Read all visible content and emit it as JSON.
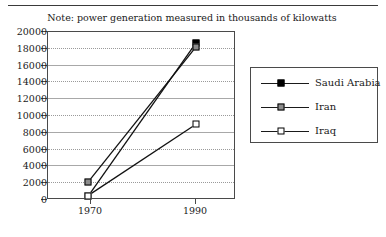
{
  "note": "Note: power generation measured in thousands of kilowatts",
  "top_caption_ghost": "",
  "legend": {
    "items": [
      {
        "label": "Saudi  Arabia",
        "marker": "filled-square-marker",
        "color": "#000000"
      },
      {
        "label": "Iran",
        "marker": "half-filled-square-marker",
        "color": "#8c8c8c"
      },
      {
        "label": "Iraq",
        "marker": "open-square-marker",
        "color": "#ffffff"
      }
    ]
  },
  "chart_data": {
    "type": "line",
    "title": "",
    "subtitle": "Note: power generation measured in thousands of kilowatts",
    "xlabel": "",
    "ylabel": "",
    "x": [
      "1970",
      "1990"
    ],
    "categories": [
      "1970",
      "1990"
    ],
    "xtick_labels": [
      "1970",
      "1990"
    ],
    "ytick_labels": [
      "0",
      "2000",
      "4000",
      "6000",
      "8000",
      "10000",
      "12000",
      "14000",
      "16000",
      "18000",
      "20000"
    ],
    "yticks": [
      0,
      2000,
      4000,
      6000,
      8000,
      10000,
      12000,
      14000,
      16000,
      18000,
      20000
    ],
    "ylim": [
      0,
      20000
    ],
    "grid": true,
    "legend_position": "right-outside",
    "series": [
      {
        "name": "Saudi  Arabia",
        "values": [
          300,
          18600
        ],
        "marker": "filled-square"
      },
      {
        "name": "Iran",
        "values": [
          2000,
          18100
        ],
        "marker": "half-filled-square"
      },
      {
        "name": "Iraq",
        "values": [
          400,
          8900
        ],
        "marker": "open-square"
      }
    ]
  }
}
